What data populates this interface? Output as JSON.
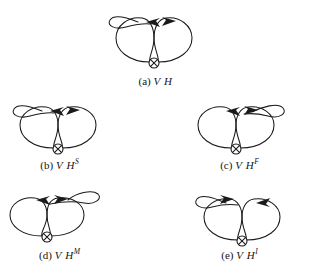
{
  "figure": {
    "type": "knot-diagram-figure",
    "stroke_color": "#1a1a1a",
    "background_color": "#ffffff",
    "crossing_symbol": "circled-times",
    "panels": [
      {
        "id": "a",
        "caption_label": "(a)",
        "caption_symbol": "V H",
        "caption_superscript": "",
        "kink_position": "upper-left",
        "arrow_left_direction": "left",
        "arrow_right_direction": "right"
      },
      {
        "id": "b",
        "caption_label": "(b)",
        "caption_symbol": "V H",
        "caption_superscript": "S",
        "kink_position": "upper-left",
        "arrow_left_direction": "left",
        "arrow_right_direction": "right"
      },
      {
        "id": "c",
        "caption_label": "(c)",
        "caption_symbol": "V H",
        "caption_superscript": "F",
        "kink_position": "upper-right",
        "arrow_left_direction": "left",
        "arrow_right_direction": "right"
      },
      {
        "id": "d",
        "caption_label": "(d)",
        "caption_symbol": "V H",
        "caption_superscript": "M",
        "kink_position": "upper-right-high",
        "arrow_left_direction": "left",
        "arrow_right_direction": "right"
      },
      {
        "id": "e",
        "caption_label": "(e)",
        "caption_symbol": "V H",
        "caption_superscript": "I",
        "kink_position": "upper-left",
        "arrow_left_direction": "right",
        "arrow_right_direction": "left"
      }
    ]
  }
}
